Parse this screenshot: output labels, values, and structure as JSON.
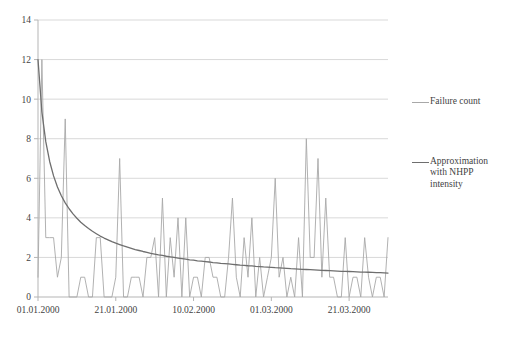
{
  "chart_data": {
    "type": "line",
    "title": "",
    "subtitle": "",
    "xlabel": "",
    "ylabel": "",
    "ylim": [
      0,
      14
    ],
    "ytick_step": 2,
    "ytick_labels": [
      "0",
      "2",
      "4",
      "6",
      "8",
      "10",
      "12",
      "14"
    ],
    "ytick_values": [
      0,
      2,
      4,
      6,
      8,
      10,
      12,
      14
    ],
    "xtick_labels": [
      "01.01.2000",
      "21.01.2000",
      "10.02.2000",
      "01.03.2000",
      "21.03.2000"
    ],
    "xtick_indices": [
      0,
      20,
      40,
      60,
      80
    ],
    "x_index_min": 0,
    "x_index_max": 90,
    "grid": "horizontal",
    "legend_position": "right",
    "colors": {
      "failure_count": "#a8a8a8",
      "approximation": "#6e6e6e",
      "gridline": "#d9d9d9",
      "axis": "#b5b5b5",
      "text": "#3f3f3f",
      "background": "#ffffff"
    },
    "series": [
      {
        "name": "Failure count",
        "color": "#a8a8a8",
        "values": [
          1,
          12,
          3,
          3,
          3,
          1,
          2,
          9,
          0,
          0,
          0,
          1,
          1,
          0,
          0,
          3,
          3,
          0,
          0,
          0,
          1,
          7,
          0,
          0,
          1,
          1,
          1,
          0,
          2,
          2,
          3,
          0,
          5,
          0,
          3,
          1,
          4,
          0,
          4,
          0,
          1,
          1,
          0,
          2,
          2,
          1,
          1,
          0,
          0,
          2,
          5,
          1,
          0,
          3,
          1,
          4,
          0,
          2,
          0,
          1,
          2,
          6,
          1,
          2,
          0,
          1,
          0,
          3,
          0,
          8,
          2,
          2,
          7,
          1,
          5,
          1,
          1,
          0,
          0,
          3,
          0,
          1,
          1,
          0,
          3,
          1,
          0,
          1,
          1,
          0,
          3
        ]
      },
      {
        "name": "Approximation with NHPP intensity",
        "color": "#6e6e6e",
        "values": [
          12.0,
          9.35,
          7.85,
          6.85,
          6.12,
          5.56,
          5.12,
          4.76,
          4.46,
          4.2,
          3.98,
          3.78,
          3.61,
          3.46,
          3.32,
          3.2,
          3.08,
          2.98,
          2.89,
          2.8,
          2.72,
          2.65,
          2.58,
          2.52,
          2.46,
          2.4,
          2.35,
          2.3,
          2.26,
          2.21,
          2.17,
          2.13,
          2.1,
          2.06,
          2.03,
          2.0,
          1.97,
          1.94,
          1.91,
          1.88,
          1.86,
          1.83,
          1.81,
          1.79,
          1.77,
          1.74,
          1.72,
          1.7,
          1.69,
          1.67,
          1.65,
          1.63,
          1.61,
          1.6,
          1.58,
          1.57,
          1.55,
          1.54,
          1.52,
          1.51,
          1.5,
          1.48,
          1.47,
          1.46,
          1.45,
          1.43,
          1.42,
          1.41,
          1.4,
          1.39,
          1.38,
          1.37,
          1.36,
          1.35,
          1.34,
          1.33,
          1.32,
          1.31,
          1.3,
          1.3,
          1.29,
          1.28,
          1.27,
          1.26,
          1.26,
          1.25,
          1.24,
          1.23,
          1.23,
          1.22,
          1.21
        ]
      }
    ]
  },
  "legend": {
    "entries": [
      {
        "label": "Failure count"
      },
      {
        "label": "Approximation\nwith NHPP\nintensity"
      }
    ]
  }
}
